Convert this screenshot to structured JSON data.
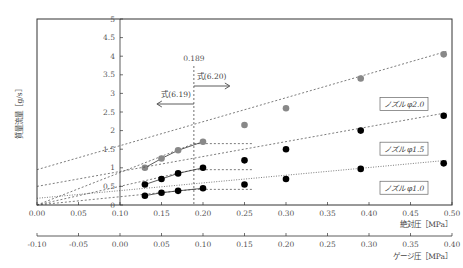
{
  "chart_data": {
    "type": "scatter",
    "title": "",
    "ylabel": "質量流量［g/s］",
    "xlabel": "絶対圧［MPa］",
    "xlabel2": "ゲージ圧［MPa］",
    "xlim": [
      0.0,
      0.5
    ],
    "ylim": [
      0,
      5
    ],
    "x_ticks": [
      "0.00",
      "0.05",
      "0.10",
      "0.15",
      "0.20",
      "0.25",
      "0.30",
      "0.35",
      "0.40",
      "0.45",
      "0.50"
    ],
    "x2_ticks": [
      "-0.10",
      "-0.05",
      "0.00",
      "0.05",
      "0.10",
      "0.15",
      "0.20",
      "0.25",
      "0.30",
      "0.35",
      "0.40"
    ],
    "y_ticks": [
      "0",
      "0.5",
      "1",
      "1.5",
      "2",
      "2.5",
      "3",
      "3.5",
      "4",
      "4.5",
      "5"
    ],
    "grid": false,
    "annotations": {
      "critical_pressure": "0.189",
      "left_formula": "式(6.19)",
      "right_formula": "式(6.20)"
    },
    "series": [
      {
        "name": "ノズル φ2.0",
        "color": "#888888",
        "x": [
          0.13,
          0.15,
          0.17,
          0.2,
          0.25,
          0.3,
          0.39,
          0.49
        ],
        "y": [
          1.0,
          1.25,
          1.47,
          1.7,
          2.15,
          2.6,
          3.4,
          4.05
        ]
      },
      {
        "name": "ノズル φ1.5",
        "color": "#000000",
        "x": [
          0.13,
          0.15,
          0.17,
          0.2,
          0.25,
          0.3,
          0.39,
          0.49
        ],
        "y": [
          0.55,
          0.7,
          0.85,
          1.0,
          1.2,
          1.5,
          2.0,
          2.4
        ]
      },
      {
        "name": "ノズル φ1.0",
        "color": "#000000",
        "x": [
          0.13,
          0.15,
          0.17,
          0.2,
          0.25,
          0.3,
          0.39,
          0.49
        ],
        "y": [
          0.25,
          0.33,
          0.38,
          0.45,
          0.55,
          0.7,
          0.97,
          1.12
        ]
      }
    ]
  }
}
